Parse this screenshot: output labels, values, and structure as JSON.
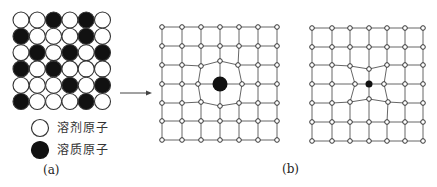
{
  "panel_a": {
    "label": "(a)",
    "grid_rows": [
      [
        "W",
        "W",
        "B",
        "W",
        "B",
        "W"
      ],
      [
        "B",
        "W",
        "W",
        "W",
        "B",
        "W"
      ],
      [
        "W",
        "B",
        "W",
        "B",
        "W",
        "B"
      ],
      [
        "B",
        "W",
        "B",
        "W",
        "W",
        "W"
      ],
      [
        "W",
        "W",
        "W",
        "B",
        "W",
        "B"
      ],
      [
        "B",
        "W",
        "W",
        "W",
        "B",
        "W"
      ]
    ],
    "legend": [
      {
        "symbol": "white-circle",
        "label": "溶剂原子"
      },
      {
        "symbol": "black-circle",
        "label": "溶质原子"
      }
    ]
  },
  "panel_b": {
    "label": "(b)",
    "lattices": [
      {
        "name": "large-solute-lattice",
        "solute": "large",
        "description": "lattice expanded around larger solute atom"
      },
      {
        "name": "small-solute-lattice",
        "solute": "small",
        "description": "lattice contracted around smaller solute atom"
      }
    ]
  },
  "colors": {
    "solvent_fill": "#ffffff",
    "solute_fill": "#111111",
    "line": "#555555"
  }
}
